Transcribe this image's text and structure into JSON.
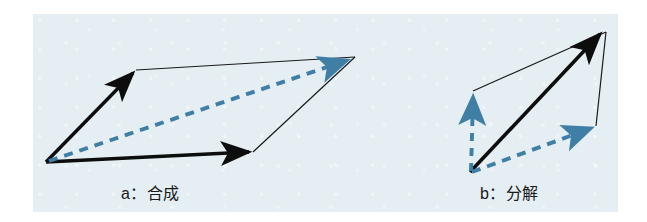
{
  "figure": {
    "kind": "vector-parallelogram-diagram",
    "background_color": "#ffffff",
    "panel_color": "#e4eef3",
    "solid_vector_color": "#000000",
    "thin_line_color": "#1a1a1a",
    "dashed_vector_color": "#3f7fa6",
    "panels": [
      {
        "id": "a",
        "caption": "a：合成",
        "description": "parallelogram law of vector composition",
        "origin": [
          46,
          162
        ],
        "vectors": [
          {
            "name": "component-vector-up",
            "style": "solid-arrow",
            "from": [
              46,
              162
            ],
            "to": [
              136,
              70
            ]
          },
          {
            "name": "component-vector-right",
            "style": "solid-arrow",
            "from": [
              46,
              162
            ],
            "to": [
              253,
              152
            ]
          },
          {
            "name": "resultant-vector-diagonal",
            "style": "dashed-arrow",
            "from": [
              46,
              162
            ],
            "to": [
              350,
              59
            ]
          }
        ],
        "construction_lines": [
          {
            "name": "parallel-line-top",
            "from": [
              136,
              70
            ],
            "to": [
              355,
              57
            ]
          },
          {
            "name": "parallel-line-right",
            "from": [
              253,
              152
            ],
            "to": [
              355,
              57
            ]
          }
        ]
      },
      {
        "id": "b",
        "caption": "b：分解",
        "description": "decomposition of a vector into two components",
        "origin": [
          470,
          172
        ],
        "vectors": [
          {
            "name": "resultant-vector-main",
            "style": "solid-arrow",
            "from": [
              470,
              172
            ],
            "to": [
              604,
              30
            ]
          },
          {
            "name": "component-vector-vertical",
            "style": "dashed-arrow",
            "from": [
              470,
              172
            ],
            "to": [
              473,
              91
            ]
          },
          {
            "name": "component-vector-slanted",
            "style": "dashed-arrow",
            "from": [
              470,
              172
            ],
            "to": [
              596,
              126
            ]
          }
        ],
        "construction_lines": [
          {
            "name": "parallel-line-upper",
            "from": [
              473,
              91
            ],
            "to": [
              606,
              32
            ]
          },
          {
            "name": "parallel-line-right",
            "from": [
              596,
              126
            ],
            "to": [
              606,
              32
            ]
          }
        ]
      }
    ]
  }
}
